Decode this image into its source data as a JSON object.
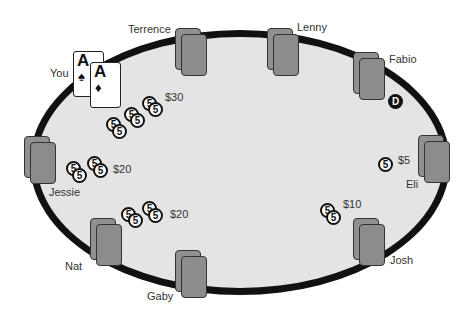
{
  "table": {
    "rail_color": "#111111",
    "felt_color": "#e4e4e4",
    "seat_color": "#8c8c8c"
  },
  "players": [
    {
      "name": "You",
      "x": 52,
      "y": 69
    },
    {
      "name": "Terrence",
      "x": 127,
      "y": 24
    },
    {
      "name": "Lenny",
      "x": 298,
      "y": 22
    },
    {
      "name": "Fabio",
      "x": 390,
      "y": 55
    },
    {
      "name": "Eli",
      "x": 405,
      "y": 180
    },
    {
      "name": "Josh",
      "x": 391,
      "y": 255
    },
    {
      "name": "Gaby",
      "x": 147,
      "y": 292
    },
    {
      "name": "Nat",
      "x": 65,
      "y": 262
    },
    {
      "name": "Jessie",
      "x": 48,
      "y": 187
    }
  ],
  "hero_cards": [
    {
      "rank": "A",
      "suit": "♠",
      "suit_name": "spades"
    },
    {
      "rank": "A",
      "suit": "♦",
      "suit_name": "diamonds"
    }
  ],
  "chip_denomination": "5",
  "bets": [
    {
      "player": "You",
      "amount": "$30",
      "chips": 6
    },
    {
      "player": "Jessie",
      "amount": "$20",
      "chips": 4
    },
    {
      "player": "Nat",
      "amount": "$20",
      "chips": 4
    },
    {
      "player": "Josh",
      "amount": "$10",
      "chips": 2
    },
    {
      "player": "Eli",
      "amount": "$5",
      "chips": 1
    }
  ],
  "dealer_button": {
    "label": "D",
    "player": "Fabio"
  }
}
